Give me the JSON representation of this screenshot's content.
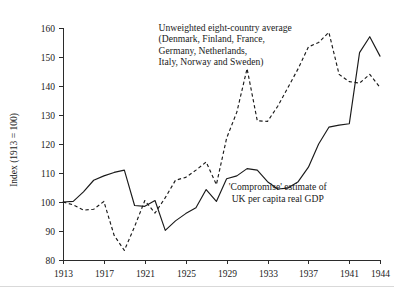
{
  "chart_data": {
    "type": "line",
    "title": "",
    "xlabel": "",
    "ylabel": "Index (1913 = 100)",
    "xlim": [
      1913,
      1944
    ],
    "ylim": [
      80,
      160
    ],
    "grid": false,
    "legend_position": "inline-annotations",
    "xticks": [
      1913,
      1917,
      1921,
      1925,
      1929,
      1933,
      1937,
      1941,
      1944
    ],
    "xtick_labels": [
      "1913",
      "1917",
      "1921",
      "1925",
      "1929",
      "1933",
      "1937",
      "1941",
      "1944"
    ],
    "yticks": [
      80,
      90,
      100,
      110,
      120,
      130,
      140,
      150,
      160
    ],
    "ytick_labels": [
      "80",
      "90",
      "100",
      "110",
      "120",
      "130",
      "140",
      "150",
      "160"
    ],
    "series": [
      {
        "name": "'Compromise' estimate of UK per capita real GDP",
        "style": "solid",
        "color": "#1a1a1a",
        "x": [
          1913,
          1914,
          1915,
          1916,
          1917,
          1918,
          1919,
          1920,
          1921,
          1922,
          1923,
          1924,
          1925,
          1926,
          1927,
          1928,
          1929,
          1930,
          1931,
          1932,
          1933,
          1934,
          1935,
          1936,
          1937,
          1938,
          1939,
          1940,
          1941,
          1942,
          1943,
          1944
        ],
        "values": [
          100.0,
          100.2,
          103.5,
          107.5,
          109.0,
          110.2,
          111.0,
          98.8,
          98.5,
          100.5,
          90.2,
          93.5,
          96.0,
          98.0,
          104.3,
          100.2,
          108.0,
          109.0,
          111.5,
          111.0,
          107.0,
          104.5,
          104.8,
          107.0,
          112.0,
          120.0,
          125.8,
          126.5,
          127.0,
          151.5,
          157.0,
          150.3
        ]
      },
      {
        "name": "Unweighted eight-country average (Denmark, Finland, France, Germany, Netherlands, Italy, Norway and Sweden)",
        "style": "dashed",
        "color": "#1a1a1a",
        "x": [
          1913,
          1914,
          1915,
          1916,
          1917,
          1918,
          1919,
          1920,
          1921,
          1922,
          1923,
          1924,
          1925,
          1926,
          1927,
          1928,
          1929,
          1930,
          1931,
          1932,
          1933,
          1934,
          1935,
          1936,
          1937,
          1938,
          1939,
          1940,
          1941,
          1942,
          1943,
          1944
        ],
        "values": [
          100.0,
          99.0,
          97.2,
          97.5,
          100.2,
          88.5,
          83.3,
          91.5,
          100.5,
          96.2,
          101.5,
          107.5,
          108.5,
          111.0,
          113.8,
          106.0,
          122.0,
          131.0,
          146.0,
          128.0,
          127.8,
          133.0,
          139.5,
          146.0,
          153.5,
          155.0,
          158.5,
          144.0,
          141.5,
          141.0,
          144.0,
          139.5
        ]
      }
    ],
    "annotations": [
      {
        "id": "eight-country-label",
        "lines": [
          "Unweighted eight-country average",
          "(Denmark, Finland, France,",
          "Germany, Netherlands,",
          "Italy, Norway and Sweden)"
        ],
        "x": 1929.0,
        "y": 159.0
      },
      {
        "id": "uk-gdp-label",
        "lines": [
          "'Compromise' estimate of",
          "UK per capita real GDP"
        ],
        "x": 1934.0,
        "y": 104.0
      }
    ]
  }
}
